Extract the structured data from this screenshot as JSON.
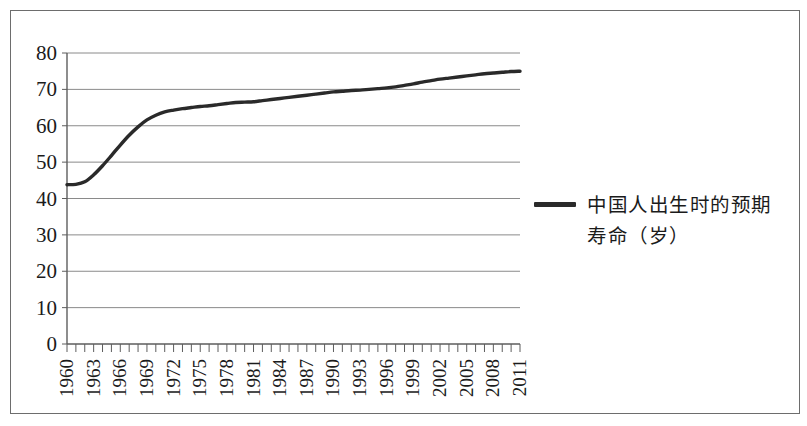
{
  "figure": {
    "background_color": "#ffffff",
    "frame_color": "#6d6d6d"
  },
  "legend": {
    "position": "right",
    "swatch_name": "line-swatch",
    "label": "中国人出生时的预期\n寿命（岁）",
    "label_line1": "中国人出生时的预期",
    "label_line2": "寿命（岁）",
    "color": "#2a2a2a"
  },
  "axes": {
    "y_ticks": [
      "0",
      "10",
      "20",
      "30",
      "40",
      "50",
      "60",
      "70",
      "80"
    ],
    "x_ticks": [
      "1960",
      "1963",
      "1966",
      "1969",
      "1972",
      "1975",
      "1978",
      "1981",
      "1984",
      "1987",
      "1990",
      "1993",
      "1996",
      "1999",
      "2002",
      "2005",
      "2008",
      "2011"
    ]
  },
  "chart_data": {
    "type": "line",
    "title": "",
    "subtitle": "",
    "xlabel": "",
    "ylabel": "",
    "xlim": [
      1960,
      2011
    ],
    "ylim": [
      0,
      80
    ],
    "grid": true,
    "grid_axis": "y",
    "legend_position": "right",
    "x_tick_step": 3,
    "y_tick_step": 10,
    "line_color": "#2a2a2a",
    "series": [
      {
        "name": "中国人出生时的预期寿命（岁）",
        "x": [
          1960,
          1961,
          1962,
          1963,
          1964,
          1965,
          1966,
          1967,
          1968,
          1969,
          1970,
          1971,
          1972,
          1973,
          1974,
          1975,
          1976,
          1977,
          1978,
          1979,
          1980,
          1981,
          1982,
          1983,
          1984,
          1985,
          1986,
          1987,
          1988,
          1989,
          1990,
          1991,
          1992,
          1993,
          1994,
          1995,
          1996,
          1997,
          1998,
          1999,
          2000,
          2001,
          2002,
          2003,
          2004,
          2005,
          2006,
          2007,
          2008,
          2009,
          2010,
          2011
        ],
        "values": [
          43.8,
          43.9,
          44.6,
          46.5,
          49.0,
          51.8,
          54.7,
          57.4,
          59.7,
          61.6,
          62.9,
          63.8,
          64.3,
          64.7,
          65.0,
          65.3,
          65.5,
          65.8,
          66.1,
          66.4,
          66.5,
          66.6,
          66.9,
          67.2,
          67.5,
          67.8,
          68.1,
          68.4,
          68.7,
          69.0,
          69.3,
          69.5,
          69.7,
          69.8,
          70.0,
          70.2,
          70.4,
          70.7,
          71.1,
          71.5,
          72.0,
          72.4,
          72.8,
          73.1,
          73.4,
          73.7,
          74.0,
          74.3,
          74.5,
          74.7,
          74.9,
          75.0
        ]
      }
    ]
  }
}
